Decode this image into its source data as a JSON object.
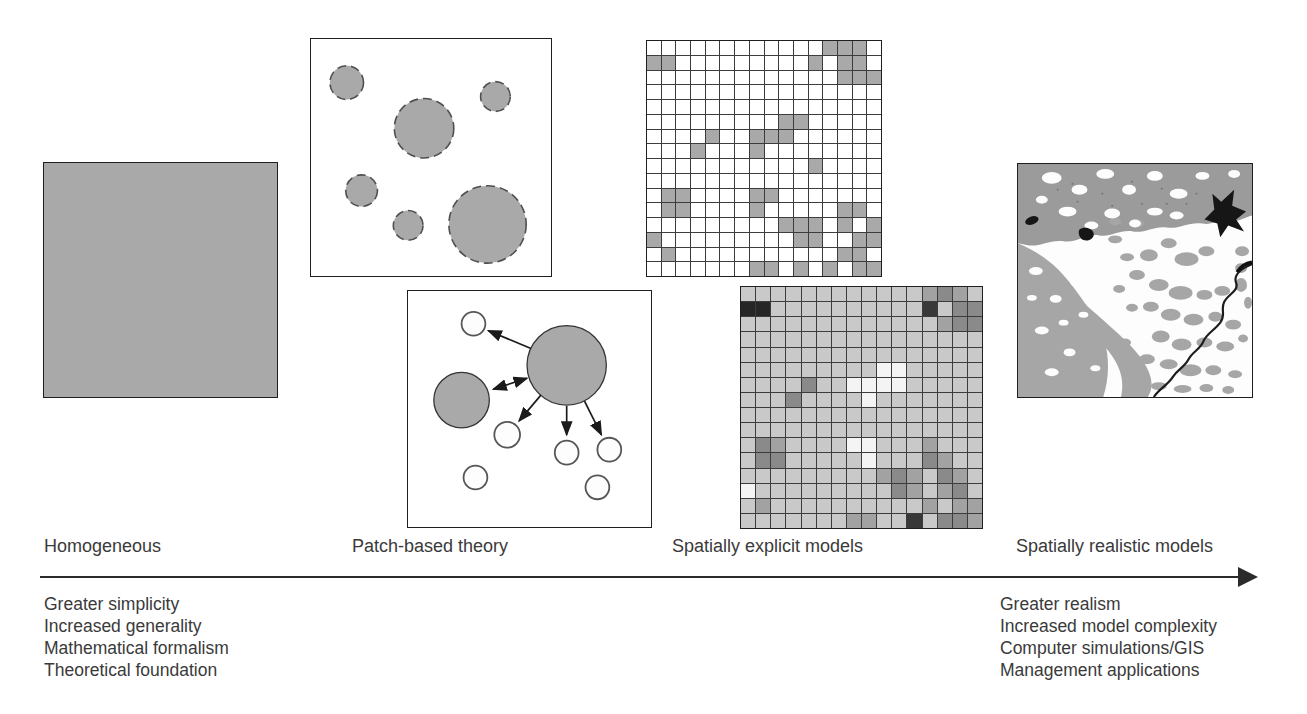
{
  "labels": {
    "homogeneous": "Homogeneous",
    "patch": "Patch-based theory",
    "explicit": "Spatially explicit models",
    "realistic": "Spatially realistic models"
  },
  "left_list": [
    "Greater simplicity",
    "Increased generality",
    "Mathematical formalism",
    "Theoretical foundation"
  ],
  "right_list": [
    "Greater realism",
    "Increased model complexity",
    "Computer simulations/GIS",
    "Management applications"
  ],
  "colors": {
    "patch_gray": "#a9a9a9",
    "grid_gray": "#a9a9a9",
    "grid_white": "#ffffff",
    "line": "#2b2b2b",
    "text": "#3a3a3a"
  },
  "patch_panel_top": {
    "circles": [
      {
        "cx": 36,
        "cy": 44,
        "r": 17
      },
      {
        "cx": 114,
        "cy": 90,
        "r": 30
      },
      {
        "cx": 186,
        "cy": 58,
        "r": 15
      },
      {
        "cx": 51,
        "cy": 153,
        "r": 16
      },
      {
        "cx": 98,
        "cy": 188,
        "r": 15
      },
      {
        "cx": 178,
        "cy": 187,
        "r": 39
      }
    ]
  },
  "patch_panel_bottom": {
    "gray_circles": [
      {
        "cx": 160,
        "cy": 75,
        "r": 40
      },
      {
        "cx": 54,
        "cy": 110,
        "r": 28
      }
    ],
    "white_circles": [
      {
        "cx": 66,
        "cy": 33,
        "r": 12
      },
      {
        "cx": 100,
        "cy": 145,
        "r": 13
      },
      {
        "cx": 68,
        "cy": 188,
        "r": 12
      },
      {
        "cx": 160,
        "cy": 163,
        "r": 12
      },
      {
        "cx": 203,
        "cy": 160,
        "r": 12
      },
      {
        "cx": 191,
        "cy": 198,
        "r": 12
      }
    ],
    "arrows": [
      {
        "x1": 124,
        "y1": 58,
        "x2": 81,
        "y2": 40,
        "double": false
      },
      {
        "x1": 120,
        "y1": 88,
        "x2": 86,
        "y2": 99,
        "double": true
      },
      {
        "x1": 134,
        "y1": 105,
        "x2": 112,
        "y2": 131,
        "double": false
      },
      {
        "x1": 160,
        "y1": 116,
        "x2": 160,
        "y2": 145,
        "double": false
      },
      {
        "x1": 178,
        "y1": 111,
        "x2": 195,
        "y2": 145,
        "double": false
      }
    ]
  },
  "grid_panel_top": {
    "cols": 16,
    "legend": {
      "0": "empty",
      "1": "occupied"
    },
    "rows": [
      "0000000000001110",
      "1100000000010110",
      "0000000000000111",
      "0000000000000000",
      "0000000000000000",
      "0000000001100000",
      "0000100111000000",
      "0001000100000000",
      "0000000000010000",
      "0000000000000000",
      "0110000110000000",
      "0110000100000110",
      "0000000001110101",
      "1000000000110011",
      "0100000000000110",
      "0000000110101011"
    ]
  },
  "grid_panel_bottom": {
    "cols": 16,
    "shades": {
      "0": "#c9c9c9",
      "1": "#f4f4f4",
      "2": "#a2a2a2",
      "3": "#8a8a8a",
      "4": "#383838",
      "5": "#262626"
    },
    "rows": [
      "0000000000002320",
      "5500000000004033",
      "0000000000000233",
      "0000000000000000",
      "0000000000000000",
      "0000000001100000",
      "0000300111100000",
      "0003000010000000",
      "0000000000000000",
      "0000000000000000",
      "0320000110002000",
      "0330000010003200",
      "0000000002320320",
      "1000000000320230",
      "0200000000002022",
      "0000000220040332"
    ]
  },
  "map_panel": {
    "type": "grayscale land-cover map",
    "palette": {
      "background": "#fdfdfd",
      "upland_gray": "#9b9b9b",
      "lowland_gray": "#a6a6a6",
      "water_black": "#161616",
      "river": "#1c1c1c"
    }
  }
}
